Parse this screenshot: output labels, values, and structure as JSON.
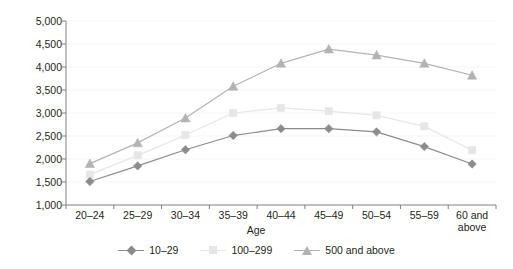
{
  "chart_data": {
    "type": "line",
    "title": "",
    "xlabel": "Age",
    "ylabel": "Thousand won",
    "categories": [
      "20–24",
      "25–29",
      "30–34",
      "35–39",
      "40–44",
      "45–49",
      "50–54",
      "55–59",
      "60 and above"
    ],
    "ylim": [
      1000,
      5000
    ],
    "yticks": [
      1000,
      1500,
      2000,
      2500,
      3000,
      3500,
      4000,
      4500,
      5000
    ],
    "ytick_labels": [
      "1,000",
      "1,500",
      "2,000",
      "2,500",
      "3,000",
      "3,500",
      "4,000",
      "4,500",
      "5,000"
    ],
    "grid": false,
    "legend_position": "bottom",
    "series": [
      {
        "name": "10–29",
        "marker": "diamond",
        "color": "#8c8c8c",
        "values": [
          1510,
          1850,
          2200,
          2510,
          2660,
          2660,
          2590,
          2270,
          1890
        ]
      },
      {
        "name": "100–299",
        "marker": "square",
        "color": "#e6e6e6",
        "values": [
          1660,
          2080,
          2520,
          3000,
          3110,
          3040,
          2950,
          2710,
          2190
        ]
      },
      {
        "name": "500 and above",
        "marker": "triangle",
        "color": "#b3b3b3",
        "values": [
          1900,
          2350,
          2890,
          3580,
          4080,
          4390,
          4260,
          4080,
          3820
        ]
      }
    ]
  },
  "axis": {
    "x_title": "Age",
    "y_title": "Thousand won"
  },
  "colors": {
    "series_1": "#8c8c8c",
    "series_2": "#e6e6e6",
    "series_3": "#b3b3b3",
    "axis": "#808080",
    "text": "#231f20",
    "background": "#ffffff"
  }
}
